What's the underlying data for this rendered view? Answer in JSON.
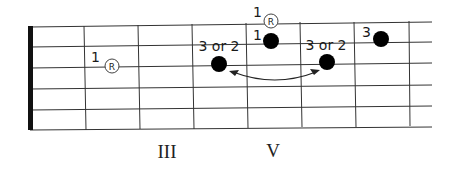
{
  "diagram": {
    "type": "guitar-fretboard",
    "strings": 6,
    "fret_markers": [
      {
        "label": "III",
        "x": 167
      },
      {
        "label": "V",
        "x": 273
      }
    ],
    "notes": [
      {
        "kind": "root",
        "symbol": "R",
        "finger": "1",
        "x": 112,
        "y": 66
      },
      {
        "kind": "dot",
        "finger": "3 or 2",
        "x": 219,
        "y": 64
      },
      {
        "kind": "root",
        "symbol": "R",
        "finger": "1",
        "x": 271,
        "y": 21
      },
      {
        "kind": "dot",
        "finger": "1",
        "x": 271,
        "y": 41
      },
      {
        "kind": "dot",
        "finger": "3 or 2",
        "x": 327,
        "y": 62
      },
      {
        "kind": "dot",
        "finger": "3",
        "x": 381,
        "y": 39
      }
    ],
    "arrow": {
      "description": "double-headed curved arrow between the two '3 or 2' dots"
    },
    "colors": {
      "line": "#333333",
      "dot": "#000000",
      "background": "#ffffff"
    }
  }
}
